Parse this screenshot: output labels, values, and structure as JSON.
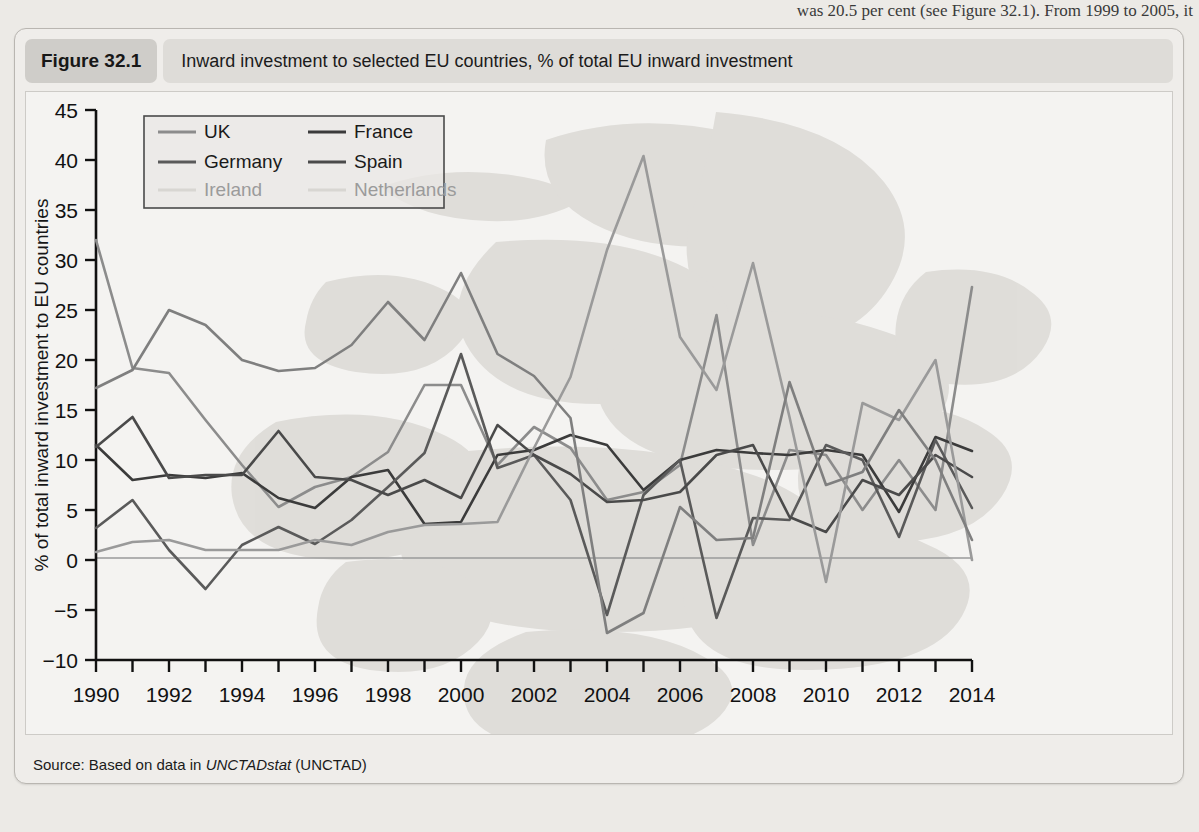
{
  "page_bleed_text": "was 20.5 per cent (see Figure 32.1). From 1999 to 2005, it",
  "figure": {
    "number_label": "Figure 32.1",
    "title": "Inward investment to selected EU countries, % of total EU inward investment",
    "source_prefix": "Source: Based on data in ",
    "source_italic": "UNCTADstat",
    "source_suffix": " (UNCTAD)"
  },
  "chart_data": {
    "type": "line",
    "title": "Inward investment to selected EU countries, % of total EU inward investment",
    "xlabel": "",
    "ylabel": "% of total inward investment to EU countries",
    "xlim": [
      1990,
      2014
    ],
    "ylim": [
      -10,
      45
    ],
    "yticks": [
      -10,
      -5,
      0,
      5,
      10,
      15,
      20,
      25,
      30,
      35,
      40,
      45
    ],
    "xticks": [
      1990,
      1991,
      1992,
      1993,
      1994,
      1995,
      1996,
      1997,
      1998,
      1999,
      2000,
      2001,
      2002,
      2003,
      2004,
      2005,
      2006,
      2007,
      2008,
      2009,
      2010,
      2011,
      2012,
      2013,
      2014
    ],
    "xtick_labels_shown": [
      1990,
      1992,
      1994,
      1996,
      1998,
      2000,
      2002,
      2004,
      2006,
      2008,
      2010,
      2012,
      2014
    ],
    "grid": false,
    "zero_line": true,
    "legend_position": "top-left",
    "x": [
      1990,
      1991,
      1992,
      1993,
      1994,
      1995,
      1996,
      1997,
      1998,
      1999,
      2000,
      2001,
      2002,
      2003,
      2004,
      2005,
      2006,
      2007,
      2008,
      2009,
      2010,
      2011,
      2012,
      2013,
      2014
    ],
    "series": [
      {
        "name": "UK",
        "color": "#8c8c8c",
        "values": [
          32.0,
          19.2,
          18.7,
          14.0,
          9.5,
          5.3,
          7.3,
          8.3,
          10.8,
          17.5,
          17.5,
          9.5,
          13.3,
          11.2,
          6.0,
          6.8,
          9.5,
          24.5,
          1.5,
          11.0,
          10.5,
          5.0,
          10.0,
          5.0,
          27.3
        ]
      },
      {
        "name": "France",
        "color": "#3b3b3b",
        "values": [
          11.5,
          8.0,
          8.5,
          8.2,
          8.7,
          6.2,
          5.2,
          8.3,
          9.0,
          3.6,
          3.8,
          10.5,
          11.0,
          12.5,
          11.5,
          7.0,
          10.0,
          11.0,
          10.7,
          10.5,
          11.0,
          10.5,
          4.8,
          12.3,
          10.9
        ]
      },
      {
        "name": "Germany",
        "color": "#5a5a5a",
        "values": [
          3.2,
          6.0,
          1.0,
          -2.9,
          1.5,
          3.3,
          1.6,
          4.0,
          7.3,
          10.7,
          20.6,
          9.2,
          10.5,
          6.0,
          -5.5,
          6.5,
          10.0,
          -5.8,
          4.2,
          4.0,
          11.5,
          10.0,
          2.3,
          12.0,
          5.2
        ]
      },
      {
        "name": "Spain",
        "color": "#4a4a4a",
        "values": [
          11.3,
          14.3,
          8.2,
          8.5,
          8.5,
          12.9,
          8.3,
          8.0,
          6.5,
          8.0,
          6.2,
          13.5,
          10.5,
          8.6,
          5.8,
          6.0,
          6.8,
          10.5,
          11.5,
          4.3,
          2.8,
          8.0,
          6.5,
          10.5,
          8.3
        ]
      },
      {
        "name": "Ireland",
        "color": "#9a9a9a",
        "values": [
          0.8,
          1.8,
          2.0,
          1.0,
          1.0,
          1.0,
          2.0,
          1.5,
          2.8,
          3.5,
          3.6,
          3.8,
          11.2,
          18.3,
          31.0,
          40.4,
          22.3,
          17.0,
          29.7,
          14.3,
          -2.2,
          15.7,
          14.0,
          20.0,
          0.0
        ]
      },
      {
        "name": "Netherlands",
        "color": "#7f7f7f",
        "values": [
          17.2,
          19.0,
          25.0,
          23.5,
          20.0,
          18.9,
          19.2,
          21.5,
          25.8,
          22.0,
          28.7,
          20.6,
          18.4,
          14.2,
          -7.3,
          -5.3,
          5.3,
          2.0,
          2.2,
          17.8,
          7.5,
          8.8,
          15.0,
          10.0,
          2.0
        ]
      }
    ]
  },
  "legend": {
    "entries": [
      {
        "label": "UK",
        "color": "#8c8c8c",
        "faint": false
      },
      {
        "label": "France",
        "color": "#3b3b3b",
        "faint": false
      },
      {
        "label": "Germany",
        "color": "#5a5a5a",
        "faint": false
      },
      {
        "label": "Spain",
        "color": "#4a4a4a",
        "faint": false
      },
      {
        "label": "Ireland",
        "color": "#d8d6d2",
        "faint": true
      },
      {
        "label": "Netherlands",
        "color": "#d8d6d2",
        "faint": true
      }
    ]
  }
}
